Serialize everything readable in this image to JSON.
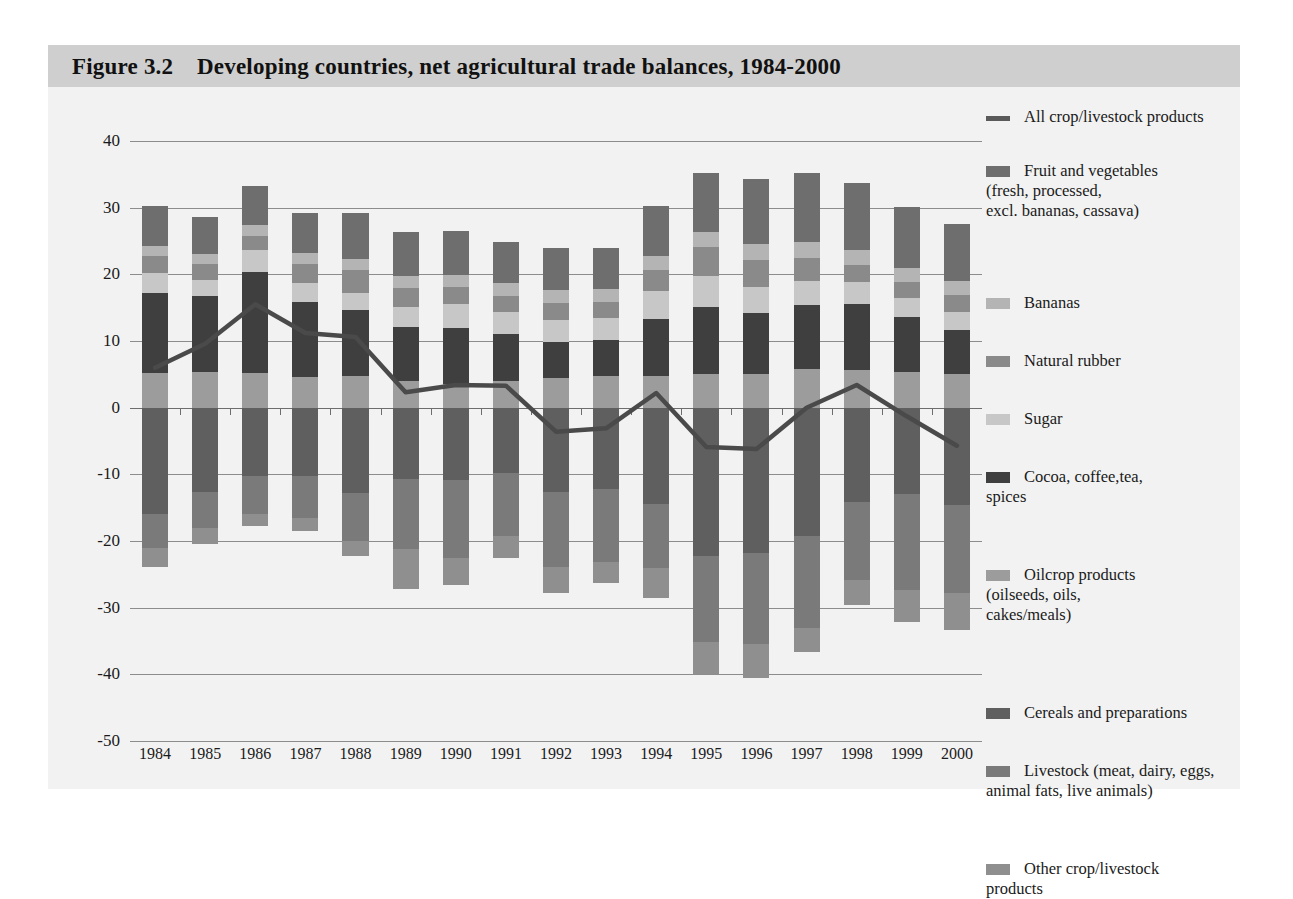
{
  "figure": {
    "title": "Figure 3.2    Developing countries, net agricultural trade balances, 1984-2000"
  },
  "chart_data": {
    "type": "bar",
    "title": "Developing countries, net agricultural trade balances, 1984-2000",
    "xlabel": "",
    "ylabel": "US$ billion (current prices)",
    "ylim": [
      -50,
      40
    ],
    "ytick_labels": [
      "40",
      "30",
      "20",
      "10",
      "0",
      "-10",
      "-20",
      "-30",
      "-40",
      "-50"
    ],
    "yticks": [
      40,
      30,
      20,
      10,
      0,
      -10,
      -20,
      -30,
      -40,
      -50
    ],
    "grid": true,
    "legend_position": "right",
    "stacked": true,
    "categories": [
      "1984",
      "1985",
      "1986",
      "1987",
      "1988",
      "1989",
      "1990",
      "1991",
      "1992",
      "1993",
      "1994",
      "1995",
      "1996",
      "1997",
      "1998",
      "1999",
      "2000"
    ],
    "series": [
      {
        "name": "Fruit and vegetables (fresh, processed, excl. bananas, cassava)",
        "color": "#6e6e6e",
        "values": [
          6.0,
          5.6,
          5.8,
          6.0,
          6.9,
          6.6,
          6.6,
          6.1,
          6.3,
          6.1,
          7.4,
          8.8,
          9.8,
          10.4,
          10.0,
          9.2,
          8.6
        ]
      },
      {
        "name": "Bananas",
        "color": "#b4b4b4",
        "values": [
          1.5,
          1.5,
          1.6,
          1.6,
          1.7,
          1.7,
          1.8,
          1.9,
          2.0,
          1.9,
          2.1,
          2.3,
          2.4,
          2.4,
          2.3,
          2.1,
          2.1
        ]
      },
      {
        "name": "Natural rubber",
        "color": "#8a8a8a",
        "values": [
          2.6,
          2.4,
          2.2,
          2.9,
          3.4,
          2.9,
          2.6,
          2.5,
          2.5,
          2.4,
          3.2,
          4.4,
          4.0,
          3.4,
          2.6,
          2.4,
          2.6
        ]
      },
      {
        "name": "Sugar",
        "color": "#c7c7c7",
        "values": [
          3.0,
          2.3,
          3.3,
          2.8,
          2.6,
          3.0,
          3.6,
          3.3,
          3.3,
          3.4,
          4.2,
          4.6,
          3.9,
          3.6,
          3.3,
          2.8,
          2.6
        ]
      },
      {
        "name": "Cocoa, coffee,tea, spices",
        "color": "#3f3f3f",
        "values": [
          12.0,
          11.4,
          15.1,
          11.3,
          9.8,
          8.1,
          8.3,
          7.0,
          5.5,
          5.3,
          8.5,
          10.1,
          9.2,
          9.6,
          9.9,
          8.2,
          6.7
        ]
      },
      {
        "name": "Oilcrop products (oilseeds, oils, cakes/meals)",
        "color": "#9c9c9c",
        "values": [
          5.2,
          5.4,
          5.2,
          4.6,
          4.8,
          4.0,
          3.6,
          4.0,
          4.4,
          4.8,
          4.8,
          5.0,
          5.0,
          5.8,
          5.6,
          5.4,
          5.0
        ]
      },
      {
        "name": "Cereals and preparations",
        "color": "#5f5f5f",
        "values": [
          -16.0,
          -12.7,
          -10.2,
          -10.2,
          -12.8,
          -10.7,
          -10.9,
          -9.8,
          -12.7,
          -12.2,
          -14.5,
          -22.2,
          -21.8,
          -19.2,
          -14.1,
          -13.0,
          -14.6
        ]
      },
      {
        "name": "Livestock (meat, dairy, eggs, animal fats, live animals)",
        "color": "#7a7a7a",
        "values": [
          -5.0,
          -5.3,
          -5.8,
          -6.4,
          -7.2,
          -10.5,
          -11.7,
          -9.5,
          -11.2,
          -10.9,
          -9.5,
          -13.0,
          -13.7,
          -13.9,
          -11.7,
          -14.4,
          -13.2
        ]
      },
      {
        "name": "Other crop/livestock products",
        "color": "#8f8f8f",
        "values": [
          -2.9,
          -2.4,
          -1.8,
          -1.9,
          -2.2,
          -6.0,
          -4.0,
          -3.3,
          -3.9,
          -3.2,
          -4.5,
          -4.7,
          -5.0,
          -3.5,
          -3.8,
          -4.8,
          -5.6
        ]
      }
    ],
    "line_series": {
      "name": "All crop/livestock products",
      "color": "#4a4a4a",
      "values": [
        6.0,
        9.6,
        15.5,
        11.2,
        10.6,
        2.3,
        3.4,
        3.3,
        -3.6,
        -3.1,
        2.2,
        -5.9,
        -6.2,
        0.0,
        3.4,
        -1.3,
        -5.7
      ]
    }
  },
  "legend": {
    "items": [
      {
        "label": "All crop/livestock products",
        "swatch": "line",
        "color": "#5a5a5a"
      },
      {
        "label": "Fruit and vegetables\n(fresh, processed,\nexcl. bananas, cassava)",
        "swatch": "box",
        "color": "#6e6e6e"
      },
      {
        "label": "Bananas",
        "swatch": "box",
        "color": "#b4b4b4"
      },
      {
        "label": "Natural rubber",
        "swatch": "box",
        "color": "#8a8a8a"
      },
      {
        "label": "Sugar",
        "swatch": "box",
        "color": "#c7c7c7"
      },
      {
        "label": "Cocoa, coffee,tea,\nspices",
        "swatch": "box",
        "color": "#3f3f3f"
      },
      {
        "label": "Oilcrop products\n(oilseeds, oils,\ncakes/meals)",
        "swatch": "box",
        "color": "#9c9c9c"
      },
      {
        "label": "Cereals and preparations",
        "swatch": "box",
        "color": "#5f5f5f"
      },
      {
        "label": "Livestock (meat, dairy, eggs,\nanimal fats, live animals)",
        "swatch": "box",
        "color": "#7a7a7a"
      },
      {
        "label": "Other crop/livestock\nproducts",
        "swatch": "box",
        "color": "#8f8f8f"
      }
    ]
  },
  "theme": {
    "panel_background": "#f2f2f2",
    "title_band": "#cfcfcf",
    "axis_color": "#8c8c8c",
    "text_color": "#1a1a1a"
  }
}
